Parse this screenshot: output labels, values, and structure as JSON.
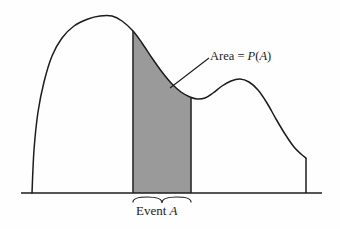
{
  "figure": {
    "title_visible": false,
    "background_color": "#fefefe",
    "curve_color": "#1c1c1c",
    "shade_color": "#9a9a9a",
    "shade_border_color": "#3a3a3a",
    "axis_color": "#1c1c1c"
  },
  "labels": {
    "area": {
      "prefix": "Area = ",
      "function": "P",
      "open_paren": "(",
      "event": "A",
      "close_paren": ")",
      "full_text": "Area = P(A)"
    },
    "event": {
      "prefix": "Event ",
      "event": "A",
      "full_text": "Event A"
    }
  },
  "chart_data": {
    "type": "area",
    "title": "",
    "xlabel": "",
    "ylabel": "",
    "grid": false,
    "legend": null,
    "xlim": [
      21,
      322
    ],
    "ylim": [
      0,
      193
    ],
    "baseline_y": 193,
    "axis_x_start": 21,
    "axis_x_end": 322,
    "density_left_edge_x": 32,
    "density_right_edge_x": 306,
    "density_right_edge_top_y": 158,
    "shaded_region": {
      "x_start": 133,
      "x_end": 191,
      "fill": "#9a9a9a",
      "label": "Event A",
      "area_label": "Area = P(A)"
    },
    "curve_points": [
      [
        32,
        193
      ],
      [
        34,
        150
      ],
      [
        38,
        112
      ],
      [
        44,
        82
      ],
      [
        52,
        56
      ],
      [
        62,
        38
      ],
      [
        74,
        26
      ],
      [
        88,
        19
      ],
      [
        100,
        16
      ],
      [
        112,
        16
      ],
      [
        122,
        21
      ],
      [
        133,
        31
      ],
      [
        142,
        43
      ],
      [
        152,
        58
      ],
      [
        162,
        72
      ],
      [
        172,
        84
      ],
      [
        181,
        92
      ],
      [
        190,
        97
      ],
      [
        197,
        99
      ],
      [
        205,
        98
      ],
      [
        213,
        93
      ],
      [
        222,
        86
      ],
      [
        231,
        81
      ],
      [
        240,
        79
      ],
      [
        249,
        82
      ],
      [
        258,
        90
      ],
      [
        267,
        103
      ],
      [
        276,
        119
      ],
      [
        285,
        134
      ],
      [
        294,
        147
      ],
      [
        301,
        154
      ],
      [
        306,
        158
      ],
      [
        306,
        193
      ]
    ],
    "features": [
      {
        "name": "primary-peak",
        "x": 106,
        "y": 16
      },
      {
        "name": "local-minimum",
        "x": 198,
        "y": 99
      },
      {
        "name": "secondary-peak",
        "x": 239,
        "y": 79
      },
      {
        "name": "right-truncation",
        "x": 306,
        "y": 158
      }
    ],
    "annotation_leader": {
      "from_x": 170,
      "from_y": 88,
      "to_x": 209,
      "to_y": 58
    },
    "brace": {
      "x_start": 133,
      "x_end": 191,
      "y": 197,
      "tip_x": 162,
      "tip_y": 203
    }
  }
}
